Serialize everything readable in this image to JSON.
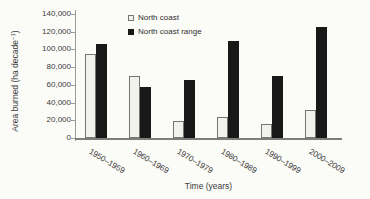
{
  "figure": {
    "background": "#fbfbf8",
    "axis_color": "#9b9b9b",
    "text_color": "#3b3b3b"
  },
  "chart_data": {
    "type": "bar",
    "title": "",
    "xlabel": "Time (years)",
    "ylabel": "Area burned (ha decade⁻¹)",
    "ylabel_parts": {
      "prefix": "Area burned (ha decade",
      "sup": "−1",
      "suffix": ")"
    },
    "categories": [
      "1950–1959",
      "1960–1969",
      "1970–1979",
      "1980–1989",
      "1990–1999",
      "2000–2009"
    ],
    "series": [
      {
        "name": "North coast",
        "fill": "#f2f2ec",
        "border": "#757575",
        "values": [
          95000,
          70000,
          19000,
          24000,
          16000,
          32000
        ]
      },
      {
        "name": "North coast range",
        "fill": "#181818",
        "border": "#181818",
        "values": [
          106000,
          58000,
          65000,
          110000,
          70000,
          125000
        ]
      }
    ],
    "ylim": [
      0,
      140000
    ],
    "y_ticks": [
      {
        "value": 0,
        "label": "0"
      },
      {
        "value": 20000,
        "label": "20,000"
      },
      {
        "value": 40000,
        "label": "40,000"
      },
      {
        "value": 60000,
        "label": "60,000"
      },
      {
        "value": 80000,
        "label": "80,000"
      },
      {
        "value": 100000,
        "label": "100,000"
      },
      {
        "value": 120000,
        "label": "120,000"
      },
      {
        "value": 140000,
        "label": "140,000"
      }
    ],
    "grid": "off",
    "legend_position": "top-inside"
  }
}
